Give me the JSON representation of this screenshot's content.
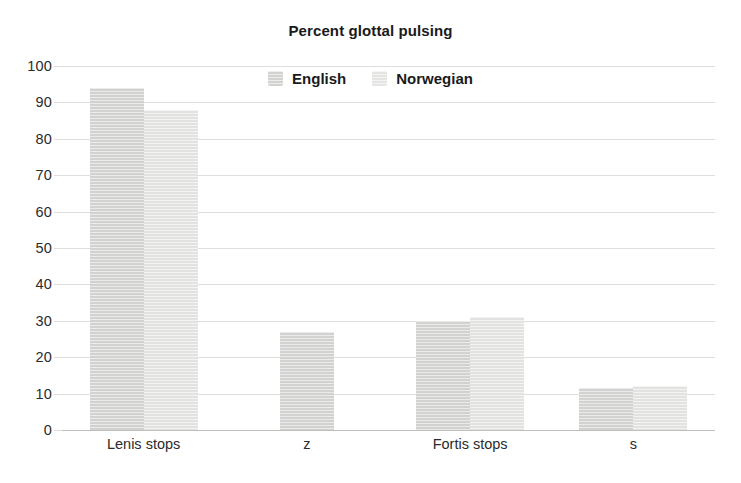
{
  "chart_data": {
    "type": "bar",
    "title": "Percent glottal pulsing",
    "xlabel": "",
    "ylabel": "",
    "ylim": [
      0,
      100
    ],
    "yticks": [
      0,
      10,
      20,
      30,
      40,
      50,
      60,
      70,
      80,
      90,
      100
    ],
    "ytick_labels": [
      "0",
      "10",
      "20",
      "30",
      "40",
      "50",
      "60",
      "70",
      "80",
      "90",
      "100"
    ],
    "categories": [
      "Lenis stops",
      "z",
      "Fortis stops",
      "s"
    ],
    "grid": true,
    "legend_position": "top-center-inside",
    "series": [
      {
        "name": "English",
        "color": "#d2d2d1",
        "values": [
          94,
          27,
          30,
          11.5
        ]
      },
      {
        "name": "Norwegian",
        "color": "#e2e2e1",
        "values": [
          88,
          null,
          31,
          12
        ]
      }
    ]
  },
  "legend": {
    "entries": [
      {
        "label": "English",
        "swatch": "english-swatch"
      },
      {
        "label": "Norwegian",
        "swatch": "norwegian-swatch"
      }
    ]
  },
  "colors": {
    "english": "#d2d2d1",
    "norwegian": "#e2e2e1",
    "gridline": "#dededd",
    "axis": "#bfbfbe",
    "text": "#1a1a1a",
    "background": "#ffffff"
  }
}
